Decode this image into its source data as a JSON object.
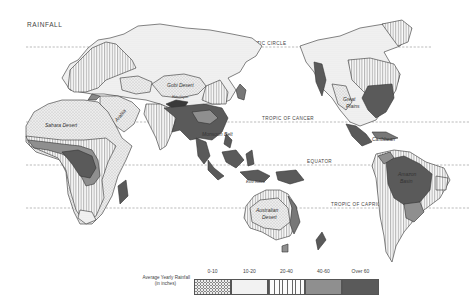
{
  "map": {
    "title": "RAINFALL",
    "reference_lines": [
      {
        "label": "ARCTIC CIRCLE",
        "y": 47
      },
      {
        "label": "TROPIC OF CANCER",
        "y": 122
      },
      {
        "label": "EQUATOR",
        "y": 165
      },
      {
        "label": "TROPIC OF CAPRICORN",
        "y": 208
      }
    ],
    "region_labels": [
      {
        "label": "Sahara Desert",
        "x": 45,
        "y": 127
      },
      {
        "label": "Arabia",
        "x": 117,
        "y": 122
      },
      {
        "label": "Gobi Desert",
        "x": 167,
        "y": 87
      },
      {
        "label": "Himalayas",
        "x": 174,
        "y": 97
      },
      {
        "label": "Monsoon Belt",
        "x": 202,
        "y": 136
      },
      {
        "label": "East Indies",
        "x": 248,
        "y": 183
      },
      {
        "label": "Australian Desert",
        "x": 258,
        "y": 215
      },
      {
        "label": "Great Plains",
        "x": 343,
        "y": 106
      },
      {
        "label": "Caribbean",
        "x": 375,
        "y": 141
      },
      {
        "label": "Amazon Basin",
        "x": 398,
        "y": 176
      }
    ]
  },
  "legend": {
    "title_line1": "Average Yearly Rainfall",
    "title_line2": "(in inches)",
    "categories": [
      {
        "label": "0-10",
        "pattern": "dots",
        "color": "#e8e8e8"
      },
      {
        "label": "10-20",
        "pattern": "fine-stipple",
        "color": "#f0f0f0"
      },
      {
        "label": "20-40",
        "pattern": "vertical-lines",
        "color": "#ffffff"
      },
      {
        "label": "40-60",
        "pattern": "solid",
        "color": "#8f8f8f"
      },
      {
        "label": "Over 60",
        "pattern": "solid",
        "color": "#5a5a5a"
      }
    ]
  }
}
